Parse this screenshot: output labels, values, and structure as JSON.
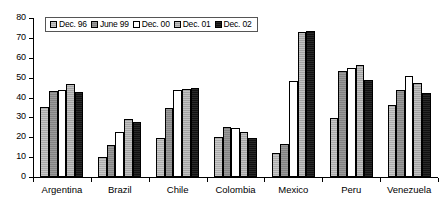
{
  "chart_data": {
    "type": "bar",
    "title": "",
    "subtitle": "",
    "xlabel": "",
    "ylabel": "",
    "ylim": [
      0,
      80
    ],
    "yticks": [
      0,
      10,
      20,
      30,
      40,
      50,
      60,
      70,
      80
    ],
    "grid": false,
    "legend_position": "top-left",
    "categories": [
      "Argentina",
      "Brazil",
      "Chile",
      "Colombia",
      "Mexico",
      "Peru",
      "Venezuela"
    ],
    "series": [
      {
        "name": "Dec. 96",
        "color": "#b0b0b0",
        "values": [
          35.0,
          10.0,
          19.8,
          20.0,
          12.2,
          29.8,
          36.0
        ]
      },
      {
        "name": "June 99",
        "color": "#8a8a8a",
        "values": [
          43.5,
          16.0,
          34.6,
          25.0,
          16.4,
          53.4,
          43.6
        ]
      },
      {
        "name": "Dec. 00",
        "color": "#ffffff",
        "values": [
          44.0,
          22.6,
          43.6,
          24.7,
          48.2,
          54.6,
          51.0
        ]
      },
      {
        "name": "Dec. 01",
        "color": "#a8a8a8",
        "values": [
          46.6,
          29.2,
          44.4,
          22.6,
          73.0,
          56.2,
          47.2
        ]
      },
      {
        "name": "Dec. 02",
        "color": "#111111",
        "values": [
          43.0,
          27.6,
          44.6,
          19.5,
          73.4,
          48.6,
          42.4
        ]
      }
    ]
  }
}
